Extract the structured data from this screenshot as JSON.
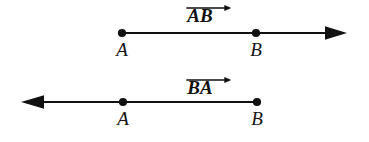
{
  "figure": {
    "width": 369,
    "height": 142,
    "background_color": "#ffffff",
    "stroke_color": "#111111"
  },
  "rows": [
    {
      "name": "ray-ab",
      "vector_label": "AB",
      "vector_label_has_overbar_arrow": true,
      "vector_label_arrow_direction": "right",
      "vector_label_center_x": 200,
      "vector_label_y": 4,
      "line_y": 33,
      "line_start_x": 122,
      "line_end_x": 347,
      "arrow_at": "right",
      "arrow_tip_x": 347,
      "points": [
        {
          "label": "A",
          "x": 122,
          "label_y": 40
        },
        {
          "label": "B",
          "x": 256,
          "label_y": 40
        }
      ]
    },
    {
      "name": "ray-ba",
      "vector_label": "BA",
      "vector_label_has_overbar_arrow": true,
      "vector_label_arrow_direction": "right",
      "vector_label_center_x": 200,
      "vector_label_y": 76,
      "line_y": 102,
      "line_start_x": 21,
      "line_end_x": 257,
      "arrow_at": "left",
      "arrow_tip_x": 21,
      "points": [
        {
          "label": "A",
          "x": 123,
          "label_y": 109
        },
        {
          "label": "B",
          "x": 257,
          "label_y": 109
        }
      ]
    }
  ]
}
